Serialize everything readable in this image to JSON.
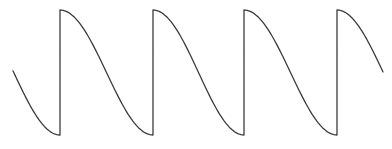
{
  "figure": {
    "stroke_color": "#3a3a3a",
    "background": "#ffffff",
    "stroke_width": 1.3
  },
  "waveform": {
    "top_y": 10,
    "bottom_y": 135,
    "start_x": 13,
    "end_x": 383,
    "jumps_x": [
      60,
      153,
      244,
      337
    ],
    "period_px": 92.5,
    "shape": "half-cosine fall followed by vertical rise"
  }
}
